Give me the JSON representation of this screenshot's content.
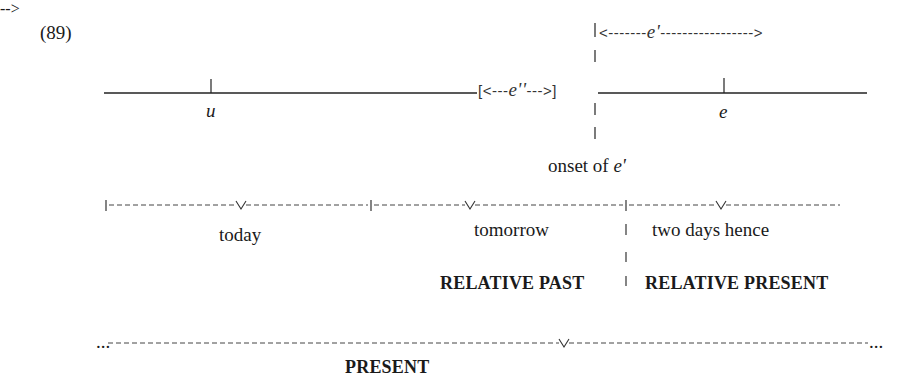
{
  "example_number": "(89)",
  "top_timeline": {
    "u_label": "u",
    "e_label": "e",
    "e_double_prime_bracket": "[<---e''--->]",
    "e_double_prime_label": "e''",
    "e_prime_arrow_label": "e'",
    "onset_label_prefix": "onset of ",
    "onset_label_var": "e'"
  },
  "day_timeline": {
    "days": [
      {
        "label": "today"
      },
      {
        "label": "tomorrow"
      },
      {
        "label": "two days hence"
      }
    ]
  },
  "relative_labels": {
    "past": "RELATIVE PAST",
    "present": "RELATIVE PRESENT"
  },
  "present_timeline": {
    "left_ellipsis": "...",
    "right_ellipsis": "...",
    "label": "PRESENT"
  }
}
